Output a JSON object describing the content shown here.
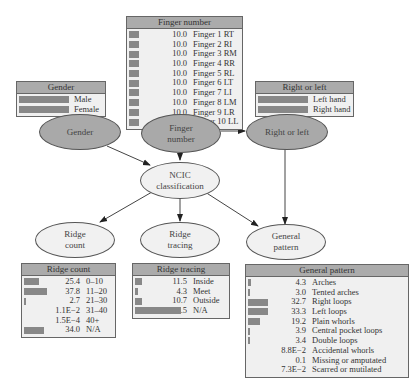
{
  "nodes": {
    "gender": "Gender",
    "finger_number": [
      "Finger",
      "number"
    ],
    "right_or_left": "Right or left",
    "ncic": [
      "NCIC",
      "classification"
    ],
    "ridge_count": [
      "Ridge",
      "count"
    ],
    "ridge_tracing": [
      "Ridge",
      "tracing"
    ],
    "general_pattern": [
      "General",
      "pattern"
    ]
  },
  "tables": {
    "finger_number": {
      "title": "Finger number",
      "rows": [
        {
          "value": "10.0",
          "pct": 10.0,
          "label": "Finger 1 RT"
        },
        {
          "value": "10.0",
          "pct": 10.0,
          "label": "Finger 2 RI"
        },
        {
          "value": "10.0",
          "pct": 10.0,
          "label": "Finger 3 RM"
        },
        {
          "value": "10.0",
          "pct": 10.0,
          "label": "Finger 4 RR"
        },
        {
          "value": "10.0",
          "pct": 10.0,
          "label": "Finger 5 RL"
        },
        {
          "value": "10.0",
          "pct": 10.0,
          "label": "Finger 6 LT"
        },
        {
          "value": "10.0",
          "pct": 10.0,
          "label": "Finger 7 LI"
        },
        {
          "value": "10.0",
          "pct": 10.0,
          "label": "Finger 8 LM"
        },
        {
          "value": "10.0",
          "pct": 10.0,
          "label": "Finger 9 LR"
        },
        {
          "value": "10.0",
          "pct": 10.0,
          "label": "Finger 10 LL"
        }
      ]
    },
    "gender": {
      "title": "Gender",
      "rows": [
        {
          "value": "50.0",
          "pct": 50.0,
          "label": "Male"
        },
        {
          "value": "50.0",
          "pct": 50.0,
          "label": "Female"
        }
      ]
    },
    "right_or_left": {
      "title": "Right or left",
      "rows": [
        {
          "value": "50.0",
          "pct": 50.0,
          "label": "Left hand"
        },
        {
          "value": "50.0",
          "pct": 50.0,
          "label": "Right hand"
        }
      ]
    },
    "ridge_count": {
      "title": "Ridge count",
      "rows": [
        {
          "value": "25.4",
          "pct": 25.4,
          "label": "0–10"
        },
        {
          "value": "37.8",
          "pct": 37.8,
          "label": "11–20"
        },
        {
          "value": "2.7",
          "pct": 2.7,
          "label": "21–30"
        },
        {
          "value": "1.1E−2",
          "pct": 0.011,
          "label": "31–40"
        },
        {
          "value": "1.5E−4",
          "pct": 0.00015,
          "label": "40+"
        },
        {
          "value": "34.0",
          "pct": 34.0,
          "label": "N/A"
        }
      ]
    },
    "ridge_tracing": {
      "title": "Ridge tracing",
      "rows": [
        {
          "value": "11.5",
          "pct": 11.5,
          "label": "Inside"
        },
        {
          "value": "4.3",
          "pct": 4.3,
          "label": "Meet"
        },
        {
          "value": "10.7",
          "pct": 10.7,
          "label": "Outside"
        },
        {
          "value": "73.5",
          "pct": 73.5,
          "label": "N/A"
        }
      ]
    },
    "general_pattern": {
      "title": "General pattern",
      "rows": [
        {
          "value": "4.3",
          "pct": 4.3,
          "label": "Arches"
        },
        {
          "value": "3.0",
          "pct": 3.0,
          "label": "Tented arches"
        },
        {
          "value": "32.7",
          "pct": 32.7,
          "label": "Right loops"
        },
        {
          "value": "33.3",
          "pct": 33.3,
          "label": "Left loops"
        },
        {
          "value": "19.2",
          "pct": 19.2,
          "label": "Plain whorls"
        },
        {
          "value": "3.9",
          "pct": 3.9,
          "label": "Central pocket loops"
        },
        {
          "value": "3.4",
          "pct": 3.4,
          "label": "Double loops"
        },
        {
          "value": "8.8E−2",
          "pct": 0.088,
          "label": "Accidental whorls"
        },
        {
          "value": "0.1",
          "pct": 0.1,
          "label": "Missing or amputated"
        },
        {
          "value": "7.3E−2",
          "pct": 0.073,
          "label": "Scarred or mutilated"
        }
      ]
    }
  },
  "edges": [
    {
      "from": "gender",
      "to": "ncic"
    },
    {
      "from": "finger_number",
      "to": "ncic"
    },
    {
      "from": "finger_number",
      "to": "right_or_left"
    },
    {
      "from": "right_or_left",
      "to": "general_pattern"
    },
    {
      "from": "ncic",
      "to": "ridge_count"
    },
    {
      "from": "ncic",
      "to": "ridge_tracing"
    },
    {
      "from": "ncic",
      "to": "general_pattern"
    }
  ]
}
